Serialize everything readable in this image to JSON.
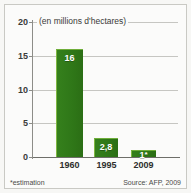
{
  "chart_data": {
    "type": "bar",
    "title": "(en millions d'hectares)",
    "xlabel": "",
    "ylabel": "",
    "categories": [
      "1960",
      "1995",
      "2009"
    ],
    "values": [
      16,
      2.8,
      1
    ],
    "value_labels": [
      "16",
      "2,8",
      "1"
    ],
    "value_label_suffixes": [
      "",
      "",
      "*"
    ],
    "ylim": [
      0,
      20
    ],
    "yticks": [
      0,
      5,
      10,
      15,
      20
    ],
    "ytick_labels": [
      "0",
      "5",
      "10",
      "15",
      "20"
    ],
    "grid": true,
    "legend": "none",
    "series": [
      {
        "name": "Surface",
        "values": [
          16,
          2.8,
          1
        ]
      }
    ],
    "footnote": "*estimation",
    "source": "Source: AFP, 2009",
    "colors": {
      "bar": "#2f7718",
      "bar_highlight": "#7fb642",
      "grid": "#c6c6c2",
      "axis": "#6e6e69",
      "text": "#2e2e2c",
      "background": "#fbfbfa",
      "value_label": "#ffffff"
    }
  }
}
